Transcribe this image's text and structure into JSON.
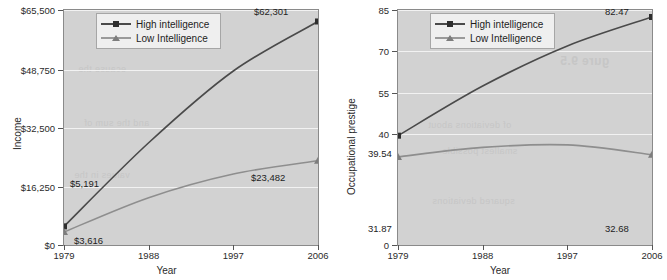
{
  "figure": {
    "panels": [
      {
        "id": "income",
        "ylabel": "Income",
        "xlabel": "Year",
        "yticks": [
          "$0",
          "$16,250",
          "$32,500",
          "$48,750",
          "$65,500"
        ],
        "xticks": [
          "1979",
          "1988",
          "1997",
          "2006"
        ],
        "legend": [
          {
            "label": "High intelligence",
            "marker": "square",
            "color": "#4a4a4a"
          },
          {
            "label": "Low Intelligence",
            "marker": "triangle",
            "color": "#8e8e8e"
          }
        ],
        "point_labels": {
          "high_start": "$5,191",
          "high_end": "$62,301",
          "low_start": "$3,616",
          "low_end": "$23,482"
        },
        "ghost_text": [
          "",
          "",
          ""
        ]
      },
      {
        "id": "prestige",
        "ylabel": "Occupational prestige",
        "xlabel": "Year",
        "yticks": [
          "0",
          "40",
          "55",
          "70",
          "85"
        ],
        "xticks": [
          "1979",
          "1988",
          "1997",
          "2006"
        ],
        "legend": [
          {
            "label": "High intelligence",
            "marker": "square",
            "color": "#4a4a4a"
          },
          {
            "label": "Low Intelligence",
            "marker": "triangle",
            "color": "#8e8e8e"
          }
        ],
        "point_labels": {
          "high_start": "39.54",
          "high_end": "82.47",
          "low_start": "31.87",
          "low_end": "32.68"
        },
        "ghost_text": [
          "gure 9.5",
          "",
          ""
        ]
      }
    ]
  },
  "chart_data": [
    {
      "type": "line",
      "title": "",
      "xlabel": "Year",
      "ylabel": "Income",
      "x": [
        1979,
        1988,
        1997,
        2006
      ],
      "xlim": [
        1979,
        2006
      ],
      "ylim": [
        0,
        65500
      ],
      "yticks": [
        0,
        16250,
        32500,
        48750,
        65500
      ],
      "ytick_labels": [
        "$0",
        "$16,250",
        "$32,500",
        "$48,750",
        "$65,500"
      ],
      "xticks": [
        1979,
        1988,
        1997,
        2006
      ],
      "grid": "horizontal",
      "legend_position": "top-center",
      "series": [
        {
          "name": "High intelligence",
          "marker": "square",
          "color": "#4a4a4a",
          "values": [
            5191,
            28500,
            48500,
            62301
          ],
          "endpoint_labels": {
            "1979": "$5,191",
            "2006": "$62,301"
          }
        },
        {
          "name": "Low Intelligence",
          "marker": "triangle",
          "color": "#8e8e8e",
          "values": [
            3616,
            13200,
            19800,
            23482
          ],
          "endpoint_labels": {
            "1979": "$3,616",
            "2006": "$23,482"
          }
        }
      ]
    },
    {
      "type": "line",
      "title": "",
      "xlabel": "Year",
      "ylabel": "Occupational prestige",
      "x": [
        1979,
        1988,
        1997,
        2006
      ],
      "xlim": [
        1979,
        2006
      ],
      "ylim": [
        0,
        85
      ],
      "yticks": [
        0,
        40,
        55,
        70,
        85
      ],
      "ytick_labels": [
        "0",
        "40",
        "55",
        "70",
        "85"
      ],
      "xticks": [
        1979,
        1988,
        1997,
        2006
      ],
      "grid": "horizontal",
      "legend_position": "top-center",
      "series": [
        {
          "name": "High intelligence",
          "marker": "square",
          "color": "#4a4a4a",
          "values": [
            39.54,
            57.5,
            72.0,
            82.47
          ],
          "endpoint_labels": {
            "1979": "39.54",
            "2006": "82.47"
          }
        },
        {
          "name": "Low Intelligence",
          "marker": "triangle",
          "color": "#8e8e8e",
          "values": [
            31.87,
            35.3,
            36.2,
            32.68
          ],
          "endpoint_labels": {
            "1979": "31.87",
            "2006": "32.68"
          }
        }
      ]
    }
  ]
}
